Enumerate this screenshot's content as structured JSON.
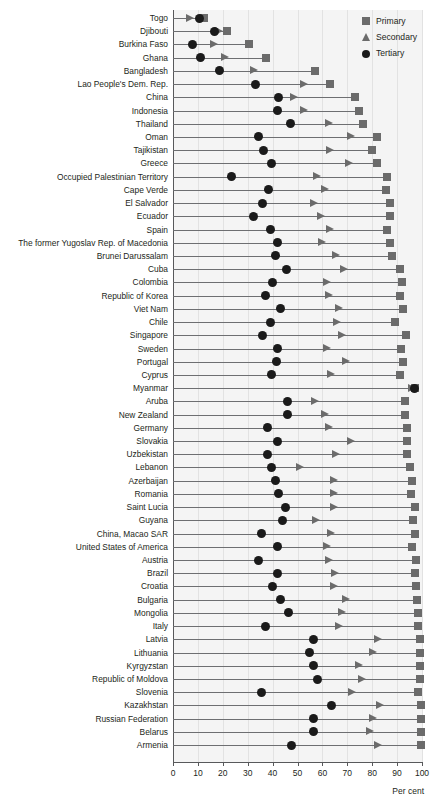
{
  "chart_data": {
    "type": "scatter",
    "title": "",
    "subtitle": "",
    "xlabel": "Per cent",
    "ylabel": "",
    "xlim": [
      0,
      100
    ],
    "xticks": [
      0,
      10,
      20,
      30,
      40,
      50,
      60,
      70,
      80,
      90,
      100
    ],
    "grid": true,
    "legend_position": "top-right",
    "legend": [
      {
        "name": "Primary",
        "marker": "square",
        "color": "#6b6b6b"
      },
      {
        "name": "Secondary",
        "marker": "triangle",
        "color": "#6b6b6b"
      },
      {
        "name": "Tertiary",
        "marker": "circle",
        "color": "#1a1a1a"
      }
    ],
    "categories": [
      "Togo",
      "Djibouti",
      "Burkina Faso",
      "Ghana",
      "Bangladesh",
      "Lao People's Dem. Rep.",
      "China",
      "Indonesia",
      "Thailand",
      "Oman",
      "Tajikistan",
      "Greece",
      "Occupied Palestinian Territory",
      "Cape Verde",
      "El Salvador",
      "Ecuador",
      "Spain",
      "The former Yugoslav Rep. of Macedonia",
      "Brunei Darussalam",
      "Cuba",
      "Colombia",
      "Republic of Korea",
      "Viet Nam",
      "Chile",
      "Singapore",
      "Sweden",
      "Portugal",
      "Cyprus",
      "Myanmar",
      "Aruba",
      "New Zealand",
      "Germany",
      "Slovakia",
      "Uzbekistan",
      "Lebanon",
      "Azerbaijan",
      "Romania",
      "Saint Lucia",
      "Guyana",
      "China, Macao SAR",
      "United States of America",
      "Austria",
      "Brazil",
      "Croatia",
      "Bulgaria",
      "Mongolia",
      "Italy",
      "Latvia",
      "Lithuania",
      "Kyrgyzstan",
      "Republic of Moldova",
      "Slovenia",
      "Kazakhstan",
      "Russian Federation",
      "Belarus",
      "Armenia"
    ],
    "series": [
      {
        "name": "Primary",
        "marker": "square",
        "values": [
          12.5,
          21.5,
          30.5,
          37.5,
          57,
          63,
          73,
          74.5,
          76.5,
          82,
          80,
          82,
          86,
          85.5,
          87,
          87,
          86,
          87,
          88,
          91,
          92,
          91,
          92.5,
          89,
          93.5,
          91.5,
          92.5,
          91,
          97,
          93,
          93,
          94,
          94,
          94,
          95,
          96,
          95.5,
          97,
          96.5,
          97,
          96,
          97.5,
          97,
          97.5,
          98,
          98.5,
          98.5,
          99,
          99,
          99,
          99,
          98.5,
          99.5,
          99.5,
          99.5,
          99.5
        ]
      },
      {
        "name": "Secondary",
        "marker": "triangle",
        "values": [
          7,
          18.5,
          16.5,
          21,
          32.5,
          52.5,
          48.5,
          52.5,
          62.5,
          71.5,
          63,
          70.5,
          58,
          61,
          56.5,
          59.5,
          63,
          60,
          65.5,
          68.5,
          62,
          62.5,
          66.5,
          66,
          68,
          62,
          69.5,
          63.5,
          96,
          57,
          61,
          62.5,
          71.5,
          65.5,
          51,
          64.5,
          64.5,
          64.5,
          57.5,
          63.5,
          62,
          62.5,
          65,
          64.5,
          69.5,
          68,
          66.5,
          82.5,
          80.5,
          74.5,
          76,
          72,
          83,
          80.5,
          79,
          82.5
        ]
      },
      {
        "name": "Tertiary",
        "marker": "circle",
        "values": [
          10.5,
          16.5,
          8,
          11,
          18.5,
          33,
          42.5,
          42,
          47,
          34.5,
          36.5,
          39.5,
          23.5,
          38.5,
          36,
          32.5,
          39,
          42,
          41,
          45.5,
          40,
          37,
          43,
          39,
          36,
          42,
          41.5,
          39.5,
          97,
          46,
          46,
          38,
          42,
          38,
          39.5,
          41,
          42.5,
          45,
          44,
          35.5,
          42,
          34.5,
          42,
          40,
          43,
          46.5,
          37,
          56.5,
          55,
          56.5,
          58,
          35.5,
          63.5,
          56.5,
          56.5,
          47.5
        ]
      }
    ]
  },
  "axis": {
    "x_title": "Per cent"
  }
}
